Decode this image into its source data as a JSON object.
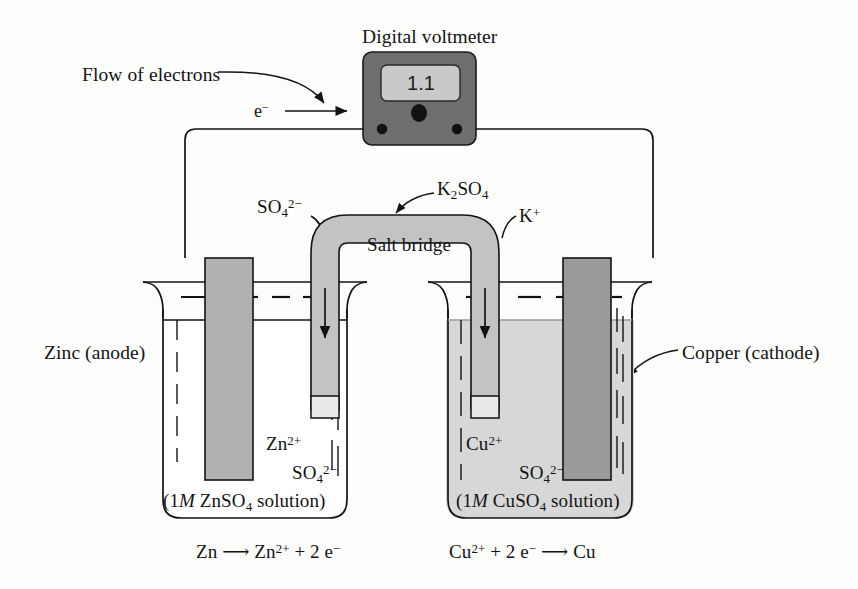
{
  "figure": {
    "background_color": "#fdfdfc",
    "ink_color": "#131313"
  },
  "voltmeter": {
    "label": "Digital voltmeter",
    "reading": "1.1",
    "body_color": "#6e6e6e",
    "display_color": "#c9c9c9",
    "terminal_color": "#111111",
    "knob_name": "voltmeter-knob"
  },
  "electron_flow": {
    "label": "Flow of electrons",
    "symbol": "e−",
    "direction": "left-to-right"
  },
  "salt_bridge": {
    "label": "Salt bridge",
    "compound": "K2SO4",
    "left_ion": "SO4 2−",
    "right_ion": "K+",
    "fill_color": "#c3c3c3",
    "plug_color": "#e8e8e8"
  },
  "left_cell": {
    "electrode_label": "Zinc (anode)",
    "electrode_color": "#b1b1b1",
    "cation": "Zn2+",
    "anion": "SO4 2−",
    "solution_caption_prefix": "(1",
    "solution_caption_molarity": "M",
    "solution_caption_suffix": " ZnSO4 solution)",
    "solution_color": "#ffffff",
    "reaction": "Zn ⟶ Zn2+ + 2 e−"
  },
  "right_cell": {
    "electrode_label": "Copper (cathode)",
    "electrode_color": "#9a9a9a",
    "cation": "Cu2+",
    "anion": "SO4 2−",
    "solution_caption_prefix": "(1",
    "solution_caption_molarity": "M",
    "solution_caption_suffix": " CuSO4 solution)",
    "solution_color": "#d7d7d7",
    "reaction": "Cu2+ + 2 e− ⟶ Cu"
  },
  "icons": {
    "arrow_electron": "arrow-right-icon",
    "arrow_pointer_voltmeter": "curved-arrow-icon",
    "arrow_pointer_k2so4": "curved-arrow-icon",
    "arrow_pointer_zinc": "curved-arrow-icon",
    "arrow_pointer_copper": "curved-arrow-icon",
    "arrow_ion_down": "arrow-down-icon"
  }
}
